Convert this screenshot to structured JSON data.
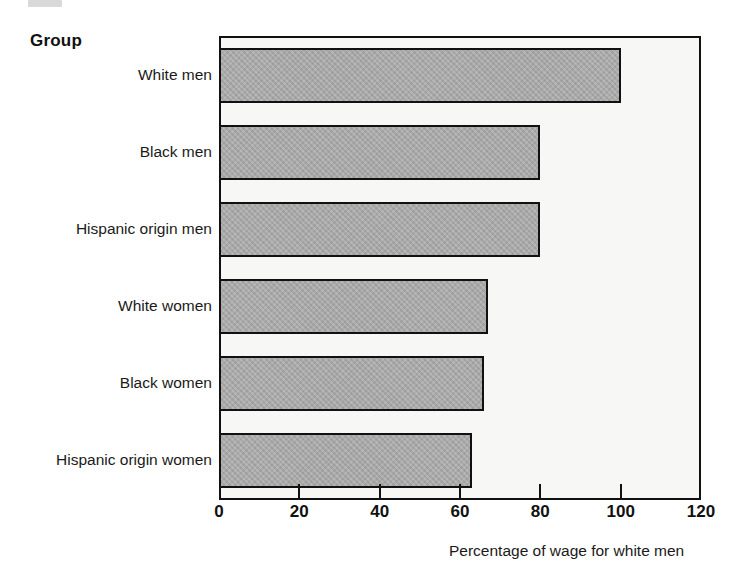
{
  "chart_data": {
    "type": "bar",
    "orientation": "horizontal",
    "title": "",
    "categories": [
      "White men",
      "Black men",
      "Hispanic origin men",
      "White women",
      "Black women",
      "Hispanic origin women"
    ],
    "values": [
      100,
      80,
      80,
      67,
      66,
      63
    ],
    "xlabel": "Percentage of wage for white men",
    "ylabel": "Group",
    "xlim": [
      0,
      120
    ],
    "xticks": [
      0,
      20,
      40,
      60,
      80,
      100,
      120
    ],
    "xtick_labels": [
      "0",
      "20",
      "40",
      "60",
      "80",
      "100",
      "120"
    ],
    "grid": false,
    "legend": null,
    "bar_fill_color": "#a9a9a9",
    "bar_edge_color": "#111111",
    "plot_background_color": "#f7f7f5"
  },
  "figure": {
    "group_axis_title": "Group",
    "x_axis_title": "Percentage of wage for white men"
  }
}
